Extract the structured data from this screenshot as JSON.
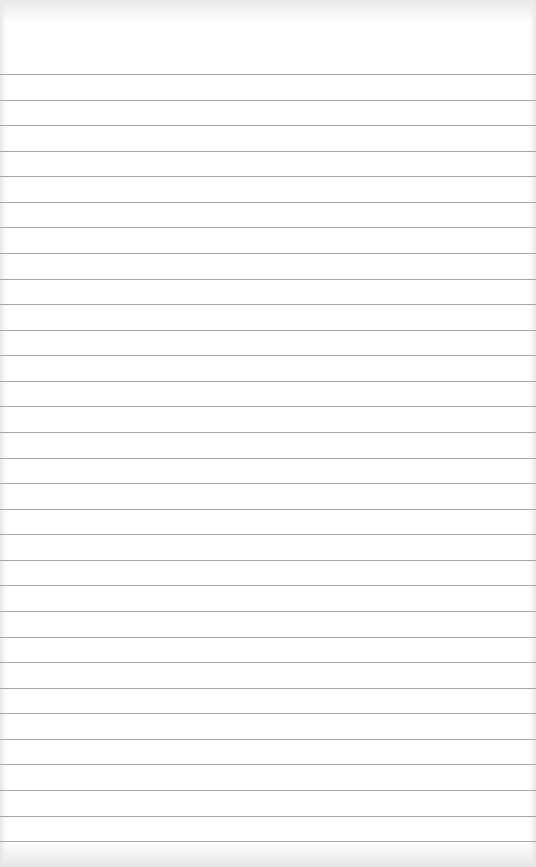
{
  "page": {
    "type": "lined-paper",
    "background_color": "#fefefe",
    "rule_color": "#a9a9a9",
    "rule_count": 31,
    "first_rule_y": 74,
    "rule_spacing": 25.57,
    "text": ""
  }
}
